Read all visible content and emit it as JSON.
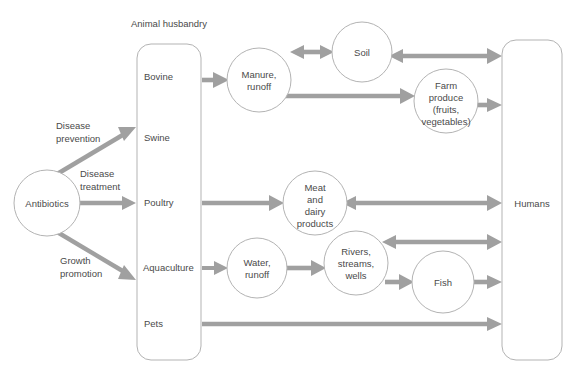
{
  "diagram": {
    "title_group": "Animal husbandry",
    "nodes": {
      "antibiotics": {
        "label": "Antibiotics",
        "shape": "circle"
      },
      "husbandry_box": {
        "label": "Animal husbandry",
        "shape": "rounded-rect"
      },
      "bovine": {
        "label": "Bovine"
      },
      "swine": {
        "label": "Swine"
      },
      "poultry": {
        "label": "Poultry"
      },
      "aquaculture": {
        "label": "Aquaculture"
      },
      "pets": {
        "label": "Pets"
      },
      "manure_runoff": {
        "label_line1": "Manure,",
        "label_line2": "runoff"
      },
      "soil": {
        "label": "Soil"
      },
      "farm_produce": {
        "label_line1": "Farm",
        "label_line2": "produce",
        "label_line3": "(fruits,",
        "label_line4": "vegetables)"
      },
      "meat_dairy": {
        "label_line1": "Meat",
        "label_line2": "and",
        "label_line3": "dairy",
        "label_line4": "products"
      },
      "water_runoff": {
        "label_line1": "Water,",
        "label_line2": "runoff"
      },
      "rivers": {
        "label_line1": "Rivers,",
        "label_line2": "streams,",
        "label_line3": "wells"
      },
      "fish": {
        "label": "Fish"
      },
      "humans": {
        "label": "Humans",
        "shape": "rounded-rect"
      }
    },
    "edge_labels": {
      "disease_prevention_l1": "Disease",
      "disease_prevention_l2": "prevention",
      "disease_treatment_l1": "Disease",
      "disease_treatment_l2": "treatment",
      "growth_promotion_l1": "Growth",
      "growth_promotion_l2": "promotion"
    },
    "colors": {
      "arrow": "#a0a0a0",
      "node_stroke": "#b3b3b3",
      "text": "#4a4a4a",
      "background": "#ffffff"
    }
  }
}
